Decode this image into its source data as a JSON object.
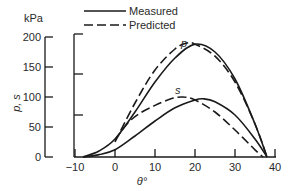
{
  "chart_data": {
    "type": "line",
    "title": "",
    "xlabel": "θ°",
    "ylabel": "p, s",
    "yunit": "kPa",
    "xlim": [
      -10,
      40
    ],
    "ylim": [
      0,
      200
    ],
    "xticks": [
      -10,
      0,
      10,
      20,
      30,
      40
    ],
    "xtick_labels": [
      "−10",
      "0",
      "10",
      "20",
      "30",
      "40"
    ],
    "yticks": [
      0,
      50,
      100,
      150,
      200
    ],
    "ytick_labels": [
      "0",
      "50",
      "100",
      "150",
      "200"
    ],
    "grid": false,
    "legend": {
      "position": "top",
      "entries": [
        {
          "label": "Measured",
          "style": "solid"
        },
        {
          "label": "Predicted",
          "style": "dashed"
        }
      ]
    },
    "annotations": [
      {
        "text": "p",
        "x": 17,
        "y": 195
      },
      {
        "text": "s",
        "x": 16,
        "y": 112
      }
    ],
    "series": [
      {
        "name": "p Measured",
        "style": "solid",
        "x": [
          -8,
          -4,
          0,
          5,
          10,
          15,
          20,
          25,
          30,
          35,
          38
        ],
        "values": [
          0,
          10,
          30,
          75,
          125,
          165,
          188,
          175,
          130,
          55,
          0
        ]
      },
      {
        "name": "p Predicted",
        "style": "dashed",
        "x": [
          0,
          5,
          10,
          15,
          18,
          20,
          25,
          30,
          35,
          38
        ],
        "values": [
          25,
          90,
          145,
          180,
          190,
          188,
          168,
          125,
          55,
          0
        ]
      },
      {
        "name": "s Measured",
        "style": "solid",
        "x": [
          -8,
          -4,
          0,
          5,
          10,
          15,
          20,
          22,
          25,
          30,
          35,
          38
        ],
        "values": [
          0,
          4,
          12,
          35,
          60,
          82,
          95,
          97,
          92,
          70,
          30,
          0
        ]
      },
      {
        "name": "s Predicted",
        "style": "dashed",
        "x": [
          0,
          3,
          6,
          10,
          14,
          17,
          20,
          25,
          30,
          35,
          37
        ],
        "values": [
          28,
          55,
          72,
          86,
          97,
          100,
          95,
          75,
          45,
          12,
          0
        ]
      }
    ]
  },
  "labels": {
    "unit": "kPa",
    "ylabel": "p, s",
    "xlabel": "θ°",
    "legend_measured": "Measured",
    "legend_predicted": "Predicted",
    "curve_p": "p",
    "curve_s": "s"
  }
}
